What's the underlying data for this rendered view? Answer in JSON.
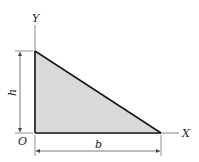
{
  "diagram": {
    "type": "right-triangle-section",
    "labels": {
      "y_axis": "Y",
      "x_axis": "X",
      "origin": "O",
      "height": "h",
      "base": "b"
    },
    "colors": {
      "fill": "#d9d9d9",
      "stroke": "#1a1a1a",
      "axis": "#888888",
      "dimension": "#555555"
    }
  }
}
